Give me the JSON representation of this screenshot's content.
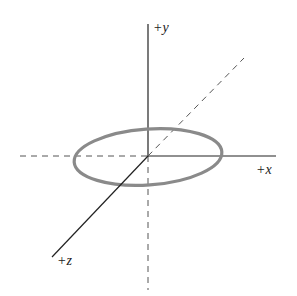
{
  "diagram": {
    "type": "3d-axes-with-ellipse",
    "axes": {
      "x": {
        "label": "+x"
      },
      "y": {
        "label": "+y"
      },
      "z": {
        "label": "+z"
      }
    },
    "shape": {
      "name": "ring",
      "color": "#8a8a8a"
    },
    "colors": {
      "axis": "#222222",
      "dashed": "#555555"
    }
  }
}
